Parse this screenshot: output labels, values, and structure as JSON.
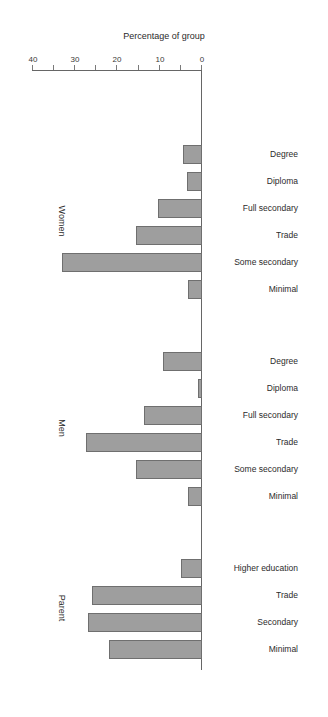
{
  "chart_data": {
    "type": "bar",
    "orientation": "horizontal",
    "title": "",
    "subtitle": "",
    "xlabel": "Percentage of group",
    "ylabel": "",
    "xlim": [
      0,
      40
    ],
    "xticks": [
      0,
      5,
      10,
      15,
      20,
      25,
      30,
      35,
      40
    ],
    "xtick_labels": [
      "0",
      "",
      "10",
      "",
      "20",
      "",
      "30",
      "",
      "40"
    ],
    "grid": false,
    "legend": "none",
    "rotated_180": true,
    "bar_color": "#9e9e9e",
    "bar_edge_color": "#6f6f6f",
    "groups": [
      {
        "name": "Parent",
        "categories": [
          "Minimal",
          "Secondary",
          "Trade",
          "Higher education"
        ],
        "values": [
          22.0,
          27.0,
          26.0,
          5.0
        ]
      },
      {
        "name": "Men",
        "categories": [
          "Minimal",
          "Some secondary",
          "Trade",
          "Full secondary",
          "Diploma",
          "Degree"
        ],
        "values": [
          3.3,
          15.5,
          27.5,
          13.8,
          1.0,
          9.3
        ]
      },
      {
        "name": "Women",
        "categories": [
          "Minimal",
          "Some secondary",
          "Trade",
          "Full secondary",
          "Diploma",
          "Degree"
        ],
        "values": [
          3.3,
          33.0,
          15.5,
          10.5,
          3.5,
          4.5
        ]
      }
    ]
  },
  "axis": {
    "x_title": "Percentage of group",
    "ticks": [
      {
        "value": 0,
        "label": "0"
      },
      {
        "value": 5,
        "label": ""
      },
      {
        "value": 10,
        "label": "10"
      },
      {
        "value": 15,
        "label": ""
      },
      {
        "value": 20,
        "label": "20"
      },
      {
        "value": 25,
        "label": ""
      },
      {
        "value": 30,
        "label": "30"
      },
      {
        "value": 35,
        "label": ""
      },
      {
        "value": 40,
        "label": "40"
      }
    ]
  }
}
